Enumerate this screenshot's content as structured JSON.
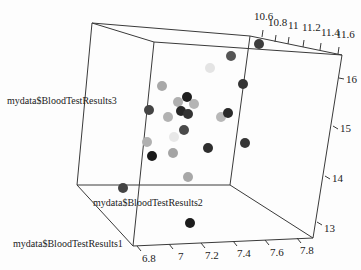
{
  "chart_data": {
    "type": "scatter",
    "subtype": "3d-scatter",
    "title": "",
    "xlabel": "mydata$BloodTestResults1",
    "ylabel": "mydata$BloodTestResults2",
    "zlabel": "mydata$BloodTestResults3",
    "x_ticks": [
      "6.8",
      "7",
      "7.2",
      "7.4",
      "7.6",
      "7.8"
    ],
    "y_ticks": [
      "10.6",
      "10.8",
      "11",
      "11.2",
      "11.4",
      "11.6"
    ],
    "z_ticks": [
      "13",
      "14",
      "15",
      "16"
    ],
    "xlim": [
      6.8,
      7.8
    ],
    "ylim": [
      10.6,
      11.6
    ],
    "zlim": [
      12.5,
      16.5
    ],
    "grid": false,
    "legend": "none",
    "color_encoding": "depth shading (darker = nearer)",
    "points_screen": [
      {
        "px": 259,
        "py": 44,
        "shade": "#3d3d3d"
      },
      {
        "px": 231,
        "py": 56,
        "shade": "#555555"
      },
      {
        "px": 210,
        "py": 68,
        "shade": "#e4e4e4"
      },
      {
        "px": 243,
        "py": 84,
        "shade": "#333333"
      },
      {
        "px": 162,
        "py": 86,
        "shade": "#a8a8a8"
      },
      {
        "px": 178,
        "py": 102,
        "shade": "#b0b0b0"
      },
      {
        "px": 194,
        "py": 104,
        "shade": "#b4b4b4"
      },
      {
        "px": 187,
        "py": 97,
        "shade": "#1e1e1e"
      },
      {
        "px": 149,
        "py": 110,
        "shade": "#444444"
      },
      {
        "px": 168,
        "py": 117,
        "shade": "#b2b2b2"
      },
      {
        "px": 181,
        "py": 111,
        "shade": "#262626"
      },
      {
        "px": 188,
        "py": 114,
        "shade": "#333333"
      },
      {
        "px": 221,
        "py": 117,
        "shade": "#b8b8b8"
      },
      {
        "px": 228,
        "py": 113,
        "shade": "#2a2a2a"
      },
      {
        "px": 184,
        "py": 130,
        "shade": "#4a4a4a"
      },
      {
        "px": 174,
        "py": 137,
        "shade": "#e8e8e8"
      },
      {
        "px": 147,
        "py": 142,
        "shade": "#b0b0b0"
      },
      {
        "px": 173,
        "py": 153,
        "shade": "#a4a4a4"
      },
      {
        "px": 152,
        "py": 156,
        "shade": "#1a1a1a"
      },
      {
        "px": 208,
        "py": 148,
        "shade": "#2e2e2e"
      },
      {
        "px": 245,
        "py": 143,
        "shade": "#363636"
      },
      {
        "px": 188,
        "py": 177,
        "shade": "#a8a8a8"
      },
      {
        "px": 123,
        "py": 188,
        "shade": "#444444"
      },
      {
        "px": 190,
        "py": 223,
        "shade": "#1c1c1c"
      }
    ]
  }
}
